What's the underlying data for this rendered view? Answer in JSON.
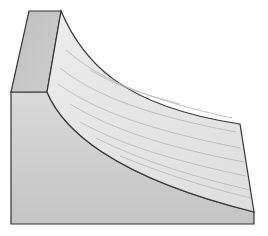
{
  "diagram": {
    "title": "",
    "colors": {
      "background": "#ffffff",
      "top_face": "#c8c8c8",
      "curved_face": "#e6e6e6",
      "front_face": "#cfcfcf",
      "outline": "#333333",
      "grain_lines": "#b4b4b4"
    },
    "faces": [
      {
        "name": "top-face",
        "label": ""
      },
      {
        "name": "curved-face",
        "label": ""
      },
      {
        "name": "front-face",
        "label": ""
      }
    ]
  }
}
